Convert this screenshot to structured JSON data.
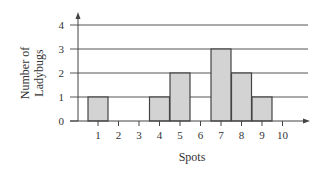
{
  "chart_data": {
    "type": "bar",
    "title": "",
    "xlabel": "Spots",
    "ylabel": "Number of Ladybugs",
    "ylabel_lines": [
      "Number of",
      "Ladybugs"
    ],
    "categories": [
      "1",
      "2",
      "3",
      "4",
      "5",
      "6",
      "7",
      "8",
      "9",
      "10"
    ],
    "values": [
      1,
      0,
      0,
      1,
      2,
      0,
      3,
      2,
      1,
      0
    ],
    "y_ticks": [
      "0",
      "1",
      "2",
      "3",
      "4"
    ],
    "ylim": [
      0,
      4
    ],
    "grid": true,
    "legend": null,
    "bar_color": "#d3d3d3",
    "bar_edge_color": "#444444",
    "grid_color": "#555555"
  }
}
